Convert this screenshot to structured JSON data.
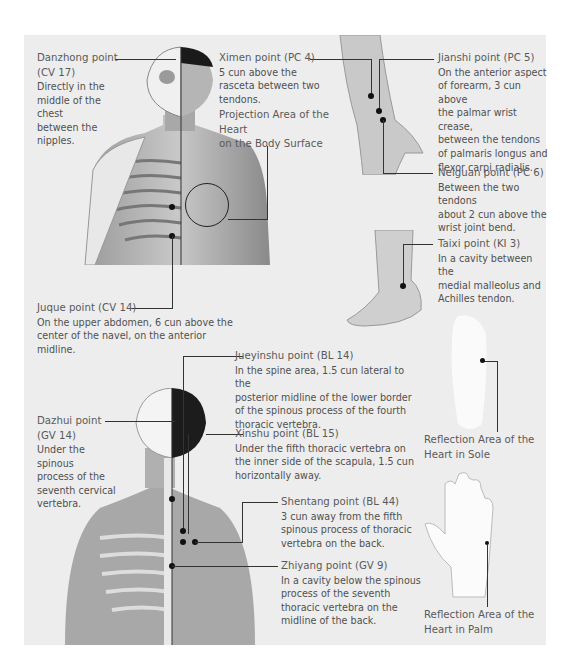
{
  "points": {
    "danzhong": {
      "name": "Danzhong point",
      "code": "(CV 17)",
      "desc": [
        "Directly in the",
        "middle of the chest",
        "between the nipples."
      ]
    },
    "ximen": {
      "name": "Ximen point (PC 4)",
      "desc": [
        "5 cun above the",
        "rasceta between two",
        "tendons."
      ]
    },
    "projection": {
      "lines": [
        "Projection Area of the Heart",
        "on the Body Surface"
      ]
    },
    "jianshi": {
      "name": "Jianshi point (PC 5)",
      "desc": [
        "On the anterior aspect",
        "of forearm, 3 cun above",
        "the palmar wrist crease,",
        "between the tendons",
        "of palmaris longus and",
        "flexor carpi radialis."
      ]
    },
    "neiguan": {
      "name": "Neiguan point (PC 6)",
      "desc": [
        "Between the two tendons",
        "about 2 cun above the",
        "wrist joint bend."
      ]
    },
    "taixi": {
      "name": "Taixi point (KI 3)",
      "desc": [
        "In a cavity between the",
        "medial malleolus and",
        "Achilles tendon."
      ]
    },
    "juque": {
      "name": "Juque point (CV 14)",
      "desc": [
        "On the upper abdomen, 6 cun above the",
        "center of the navel, on the anterior midline."
      ]
    },
    "jueyinshu": {
      "name": "Jueyinshu point (BL 14)",
      "desc": [
        "In the spine area, 1.5 cun lateral to the",
        "posterior midline of the lower border",
        "of the spinous process of the fourth",
        "thoracic vertebra."
      ]
    },
    "dazhui": {
      "name": "Dazhui point",
      "code": "(GV 14)",
      "desc": [
        "Under the spinous",
        "process of the",
        "seventh cervical",
        "vertebra."
      ]
    },
    "xinshu": {
      "name": "Xinshu point (BL 15)",
      "desc": [
        "Under the fifth thoracic vertebra on",
        "the inner side of the scapula, 1.5 cun",
        "horizontally away."
      ]
    },
    "shentang": {
      "name": "Shentang point (BL 44)",
      "desc": [
        "3 cun away from the fifth",
        "spinous process of thoracic",
        "vertebra on the back."
      ]
    },
    "zhiyang": {
      "name": "Zhiyang point (GV 9)",
      "desc": [
        "In a cavity below the spinous",
        "process of the seventh",
        "thoracic vertebra on the",
        "midline of the back."
      ]
    }
  },
  "reflection": {
    "sole": {
      "lines": [
        "Reflection Area of the",
        "Heart in Sole"
      ]
    },
    "palm": {
      "lines": [
        "Reflection Area of the",
        "Heart in Palm"
      ]
    }
  },
  "colors": {
    "panel": "#ededed",
    "text": "#505050",
    "line": "#333333",
    "dot": "#111111"
  }
}
